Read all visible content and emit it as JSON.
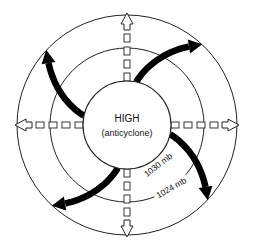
{
  "diagram": {
    "center_label": "HIGH",
    "center_sublabel": "(anticyclone)",
    "isobars": [
      {
        "label": "1030 mb",
        "ring": "inner"
      },
      {
        "label": "1024 mb",
        "ring": "middle"
      }
    ],
    "divergence_arrows": [
      "up",
      "right",
      "down",
      "left"
    ],
    "surface_winds": [
      "northeast",
      "southeast",
      "southwest",
      "northwest"
    ],
    "colors": {
      "line": "#222222",
      "wind_arrow": "#000000",
      "background": "#ffffff"
    }
  }
}
